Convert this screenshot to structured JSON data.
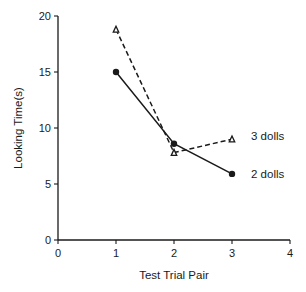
{
  "chart_data": {
    "type": "line",
    "title": "",
    "xlabel": "Test Trial Pair",
    "ylabel": "Looking Time(s)",
    "xlim": [
      0,
      4
    ],
    "ylim": [
      0,
      20
    ],
    "x_ticks": [
      0,
      1,
      2,
      3,
      4
    ],
    "y_ticks": [
      0,
      5,
      10,
      15,
      20
    ],
    "x_tick_labels": [
      "0",
      "1",
      "2",
      "3",
      "4"
    ],
    "y_tick_labels": [
      "0",
      "5",
      "10",
      "15",
      "20"
    ],
    "grid": false,
    "legend_position": "inline labels at right end of each line",
    "x": [
      1,
      2,
      3
    ],
    "series": [
      {
        "name": "3 dolls",
        "values": [
          18.8,
          7.8,
          9.0
        ],
        "line_style": "dashed",
        "marker": "open-triangle",
        "color": "#1a1a1a"
      },
      {
        "name": "2 dolls",
        "values": [
          15.0,
          8.6,
          5.9
        ],
        "line_style": "solid",
        "marker": "filled-circle",
        "color": "#1a1a1a"
      }
    ]
  }
}
